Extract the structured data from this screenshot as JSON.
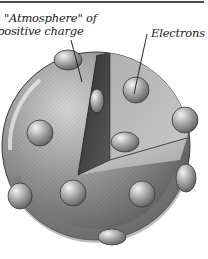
{
  "figure": {
    "labels": {
      "atmosphere_line1": "\"Atmosphere\" of",
      "atmosphere_line2": "positive charge",
      "electrons": "Electrons"
    },
    "colors": {
      "sphere_light": "#c9c9c9",
      "sphere_mid": "#8e8e8e",
      "sphere_dark": "#4d4d4d",
      "cut_face_light": "#b5b5b5",
      "cut_face_dark": "#3e3e3e",
      "electron": "#a8a8a8",
      "rule": "#4a4a4a"
    },
    "electron_count_visible": 11
  }
}
